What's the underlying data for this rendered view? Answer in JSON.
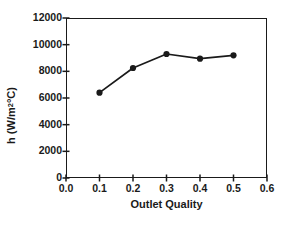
{
  "chart_data": {
    "type": "line",
    "title": "",
    "xlabel": "Outlet Quality",
    "ylabel": "h (W/m2 oC)",
    "ylabel_parts": {
      "prefix": "h (W/m",
      "superscript": "2",
      "middle": " ",
      "degree": "°C)"
    },
    "x": [
      0.1,
      0.2,
      0.3,
      0.4,
      0.5
    ],
    "values": [
      6400,
      8250,
      9300,
      8950,
      9200
    ],
    "series": [
      {
        "name": "h",
        "x": [
          0.1,
          0.2,
          0.3,
          0.4,
          0.5
        ],
        "values": [
          6400,
          8250,
          9300,
          8950,
          9200
        ]
      }
    ],
    "xlim": [
      0.0,
      0.6
    ],
    "ylim": [
      0,
      12000
    ],
    "xticks": [
      0.0,
      0.1,
      0.2,
      0.3,
      0.4,
      0.5,
      0.6
    ],
    "xtick_labels": [
      "0.0",
      "0.1",
      "0.2",
      "0.3",
      "0.4",
      "0.5",
      "0.6"
    ],
    "yticks": [
      0,
      2000,
      4000,
      6000,
      8000,
      10000,
      12000
    ],
    "ytick_labels": [
      "0",
      "2000",
      "4000",
      "6000",
      "8000",
      "10000",
      "12000"
    ],
    "grid": false,
    "legend": false,
    "marker": "filled-circle",
    "line_color": "#1a1a1a",
    "marker_color": "#1a1a1a",
    "background_color": "#ffffff",
    "axis_color": "#1a1a1a"
  }
}
